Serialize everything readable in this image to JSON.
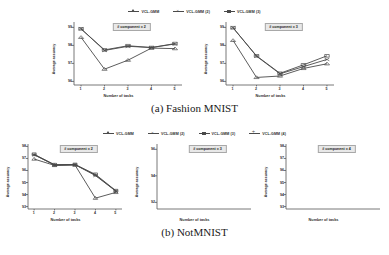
{
  "figure": {
    "axis_labels": {
      "y": "Average accuracy",
      "x": "Number of tasks"
    }
  },
  "subfigures": [
    {
      "id": "a",
      "caption": "(a) Fashion MNIST",
      "legend": [
        {
          "label": "VCL-GMM",
          "marker": "triangle",
          "color": "#4a4a4a"
        },
        {
          "label": "VCL-GMM (2)",
          "marker": "x",
          "color": "#4a4a4a"
        },
        {
          "label": "VCL-GMM (3)",
          "marker": "square",
          "color": "#4a4a4a"
        }
      ],
      "plots": [
        {
          "title": "# component = 2",
          "ylabel": "Average accuracy",
          "xlabel": "Number of tasks",
          "yticks": [
            "99",
            "98",
            "97",
            "96"
          ],
          "xticks": [
            "1",
            "2",
            "3",
            "4",
            "5"
          ]
        },
        {
          "title": "# component = 3",
          "ylabel": "Average accuracy",
          "xlabel": "Number of tasks",
          "yticks": [
            "99",
            "98",
            "97",
            "96"
          ],
          "xticks": [
            "1",
            "2",
            "3",
            "4",
            "5"
          ]
        }
      ]
    },
    {
      "id": "b",
      "caption": "(b) NotMNIST",
      "legend": [
        {
          "label": "VCL-GMM",
          "marker": "triangle",
          "color": "#4a4a4a"
        },
        {
          "label": "VCL-GMM (2)",
          "marker": "x",
          "color": "#4a4a4a"
        },
        {
          "label": "VCL-GMM (3)",
          "marker": "square",
          "color": "#4a4a4a"
        },
        {
          "label": "VCL-GMM (4)",
          "marker": "plus",
          "color": "#4a4a4a"
        }
      ],
      "plots": [
        {
          "title": "# component = 2",
          "ylabel": "Average accuracy",
          "xlabel": "Number of tasks",
          "yticks": [
            "98",
            "97",
            "96",
            "95",
            "94",
            "93"
          ],
          "xticks": [
            "1",
            "2",
            "3",
            "4",
            "5"
          ]
        },
        {
          "title": "# component = 3",
          "ylabel": "Average accuracy",
          "xlabel": "Number of tasks",
          "yticks": [
            "96",
            "94",
            "92"
          ],
          "xticks": [
            "1",
            "2",
            "3",
            "4",
            "5"
          ]
        },
        {
          "title": "# component = 4",
          "ylabel": "Average accuracy",
          "xlabel": "Number of tasks",
          "yticks": [
            "98",
            "97",
            "96",
            "95",
            "94",
            "93"
          ],
          "xticks": [
            "1",
            "2",
            "3",
            "4",
            "5"
          ]
        }
      ]
    }
  ],
  "chart_data": [
    {
      "type": "line",
      "title": "# component = 2",
      "subfigure": "(a) Fashion MNIST",
      "xlabel": "Number of tasks",
      "ylabel": "Average accuracy",
      "x": [
        1,
        2,
        3,
        4,
        5
      ],
      "xlim": [
        0.7,
        5.3
      ],
      "ylim": [
        95.8,
        99.3
      ],
      "grid": false,
      "legend_position": "above-figure",
      "series": [
        {
          "name": "VCL-GMM",
          "marker": "triangle",
          "values": [
            98.45,
            96.68,
            97.18,
            97.85,
            97.82
          ]
        },
        {
          "name": "VCL-GMM (2)",
          "marker": "x",
          "values": [
            98.92,
            97.72,
            97.95,
            97.88,
            98.08
          ]
        },
        {
          "name": "VCL-GMM (3)",
          "marker": "square",
          "values": [
            98.92,
            97.75,
            97.98,
            97.88,
            98.1
          ]
        }
      ]
    },
    {
      "type": "line",
      "title": "# component = 3",
      "subfigure": "(a) Fashion MNIST",
      "xlabel": "Number of tasks",
      "ylabel": "Average accuracy",
      "x": [
        1,
        2,
        3,
        4,
        5
      ],
      "xlim": [
        0.7,
        5.3
      ],
      "ylim": [
        95.8,
        99.3
      ],
      "grid": false,
      "legend_position": "above-figure",
      "series": [
        {
          "name": "VCL-GMM",
          "marker": "triangle",
          "values": [
            98.28,
            96.22,
            96.3,
            96.72,
            96.98
          ]
        },
        {
          "name": "VCL-GMM (2)",
          "marker": "x",
          "values": [
            98.98,
            97.4,
            96.42,
            96.82,
            97.22
          ]
        },
        {
          "name": "VCL-GMM (3)",
          "marker": "square",
          "values": [
            98.98,
            97.42,
            96.45,
            96.92,
            97.42
          ]
        }
      ]
    },
    {
      "type": "line",
      "title": "# component = 2",
      "subfigure": "(b) NotMNIST",
      "xlabel": "Number of tasks",
      "ylabel": "Average accuracy",
      "x": [
        1,
        2,
        3,
        4,
        5
      ],
      "xlim": [
        0.7,
        5.3
      ],
      "ylim": [
        92.8,
        98.2
      ],
      "grid": false,
      "legend_position": "above-figure",
      "series": [
        {
          "name": "VCL-GMM",
          "marker": "triangle",
          "values": [
            96.95,
            96.42,
            96.45,
            93.7,
            94.18
          ]
        },
        {
          "name": "VCL-GMM (2)",
          "marker": "x",
          "values": [
            97.3,
            96.45,
            96.48,
            95.58,
            94.28
          ]
        },
        {
          "name": "VCL-GMM (3)",
          "marker": "square",
          "values": [
            97.35,
            96.48,
            96.5,
            95.68,
            94.32
          ]
        },
        {
          "name": "VCL-GMM (4)",
          "marker": "plus",
          "values": [
            97.32,
            96.46,
            96.49,
            95.62,
            94.3
          ]
        }
      ]
    },
    {
      "type": "line",
      "title": "# component = 3",
      "subfigure": "(b) NotMNIST",
      "xlabel": "Number of tasks",
      "ylabel": "Average accuracy",
      "x": [
        1,
        2,
        3,
        4,
        5
      ],
      "xlim": [
        91.5,
        96.4
      ],
      "ylim": [
        91.5,
        96.4
      ],
      "grid": false,
      "legend_position": "above-figure",
      "series": [
        {
          "name": "VCL-GMM",
          "marker": "triangle",
          "values": [
            95.72,
            94.9,
            93.7,
            93.55,
            92.35
          ]
        },
        {
          "name": "VCL-GMM (2)",
          "marker": "x",
          "values": [
            95.8,
            94.85,
            95.0,
            94.3,
            93.4
          ]
        },
        {
          "name": "VCL-GMM (3)",
          "marker": "square",
          "values": [
            95.82,
            95.05,
            95.05,
            94.38,
            93.85
          ]
        },
        {
          "name": "VCL-GMM (4)",
          "marker": "plus",
          "values": [
            95.78,
            94.92,
            95.02,
            94.32,
            93.6
          ]
        }
      ]
    },
    {
      "type": "line",
      "title": "# component = 4",
      "subfigure": "(b) NotMNIST",
      "xlabel": "Number of tasks",
      "ylabel": "Average accuracy",
      "x": [
        1,
        2,
        3,
        4,
        5
      ],
      "xlim": [
        92.8,
        98.2
      ],
      "ylim": [
        92.8,
        98.2
      ],
      "grid": false,
      "legend_position": "above-figure",
      "series": [
        {
          "name": "VCL-GMM",
          "marker": "triangle",
          "values": [
            96.8,
            95.72,
            94.32,
            94.75,
            93.85
          ]
        },
        {
          "name": "VCL-GMM (2)",
          "marker": "x",
          "values": [
            97.2,
            95.95,
            96.4,
            95.8,
            96.18
          ]
        },
        {
          "name": "VCL-GMM (3)",
          "marker": "square",
          "values": [
            97.25,
            96.05,
            96.45,
            95.88,
            96.22
          ]
        },
        {
          "name": "VCL-GMM (4)",
          "marker": "plus",
          "values": [
            97.22,
            96.0,
            96.42,
            95.84,
            96.2
          ]
        }
      ]
    }
  ]
}
